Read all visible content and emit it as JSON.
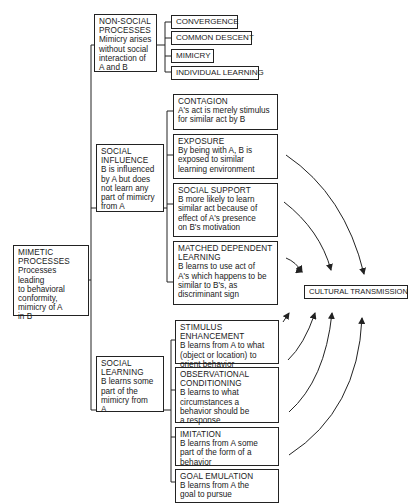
{
  "root": {
    "title": "MIMETIC PROCESSES",
    "desc": [
      "Processes leading",
      "to behavioral",
      "conformity,",
      "mimicry of A",
      "in B"
    ]
  },
  "nonsocial": {
    "title": [
      "NON-SOCIAL",
      "PROCESSES"
    ],
    "desc": [
      "Mimicry arises",
      "without social",
      "interaction of",
      "A and B"
    ],
    "children": [
      "CONVERGENCE",
      "COMMON DESCENT",
      "MIMICRY",
      "INDIVIDUAL LEARNING"
    ]
  },
  "social_influence": {
    "title": [
      "SOCIAL",
      "INFLUENCE"
    ],
    "desc": [
      "B is influenced",
      "by A but does",
      "not learn any",
      "part of mimicry",
      "from A"
    ],
    "children": [
      {
        "title": "CONTAGION",
        "desc": [
          "A's act is merely stimulus",
          "for similar act by B"
        ]
      },
      {
        "title": "EXPOSURE",
        "desc": [
          "By being with A, B is",
          "exposed to similar",
          "learning environment"
        ]
      },
      {
        "title": "SOCIAL SUPPORT",
        "desc": [
          "B more likely to learn",
          "similar act because of",
          "effect of A's presence",
          "on B's motivation"
        ]
      },
      {
        "title": "MATCHED DEPENDENT",
        "title2": "LEARNING",
        "desc": [
          "B learns to use act of",
          "A's which happens to be",
          "similar to B's, as",
          "discriminant sign"
        ]
      }
    ]
  },
  "social_learning": {
    "title": [
      "SOCIAL",
      "LEARNING"
    ],
    "desc": [
      "B learns some",
      "part of the",
      "mimicry from",
      "A"
    ],
    "children": [
      {
        "title": "STIMULUS ENHANCEMENT",
        "desc": [
          "B learns from A to what",
          "(object or location) to",
          "orient behavior"
        ]
      },
      {
        "title": "OBSERVATIONAL",
        "title2": "CONDITIONING",
        "desc": [
          "B learns to what",
          "circumstances a",
          "behavior should be",
          "a response"
        ]
      },
      {
        "title": "IMITATION",
        "desc": [
          "B learns from A some",
          "part of the form of a",
          "behavior"
        ]
      },
      {
        "title": "GOAL EMULATION",
        "desc": [
          "B learns from A the",
          "goal to pursue"
        ]
      }
    ]
  },
  "target": {
    "label": "CULTURAL TRANSMISSION"
  }
}
